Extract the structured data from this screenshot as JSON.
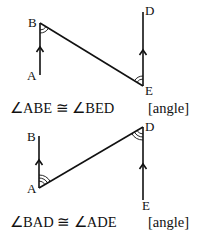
{
  "figures": [
    {
      "points": {
        "A": "A",
        "B": "B",
        "D": "D",
        "E": "E"
      },
      "statement": "∠ABE ≅ ∠BED",
      "reason": "[angle]"
    },
    {
      "points": {
        "A": "A",
        "B": "B",
        "D": "D",
        "E": "E"
      },
      "statement": "∠BAD ≅ ∠ADE",
      "reason": "[angle]"
    }
  ]
}
